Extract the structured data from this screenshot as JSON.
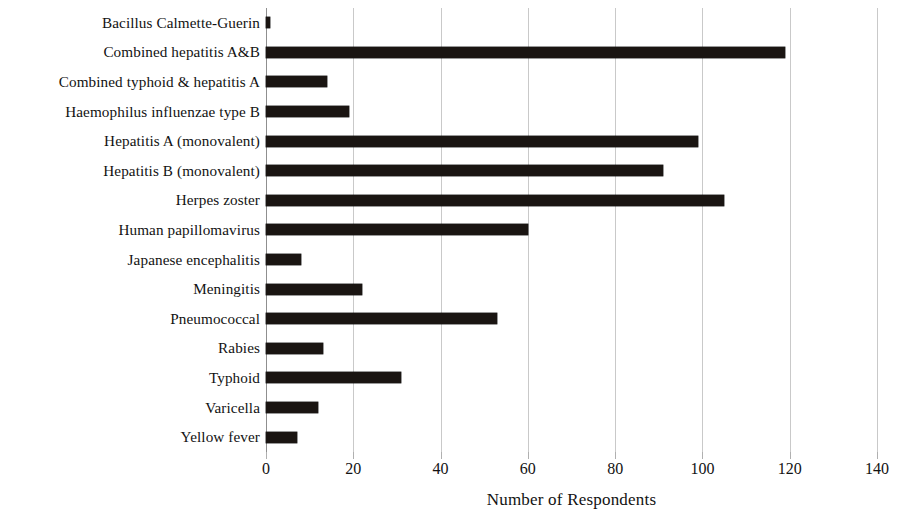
{
  "chart_data": {
    "type": "bar",
    "orientation": "horizontal",
    "title": "",
    "xlabel": "Number of Respondents",
    "ylabel": "",
    "xlim": [
      0,
      140
    ],
    "xticks": [
      0,
      20,
      40,
      60,
      80,
      100,
      120,
      140
    ],
    "xtick_labels": [
      "0",
      "20",
      "40",
      "60",
      "80",
      "100",
      "120",
      "140"
    ],
    "grid": "vertical",
    "legend": "none",
    "bar_color": "#1a1512",
    "categories": [
      "Bacillus Calmette-Guerin",
      "Combined hepatitis A&B",
      "Combined typhoid & hepatitis A",
      "Haemophilus influenzae type B",
      "Hepatitis A (monovalent)",
      "Hepatitis B (monovalent)",
      "Herpes zoster",
      "Human papillomavirus",
      "Japanese encephalitis",
      "Meningitis",
      "Pneumococcal",
      "Rabies",
      "Typhoid",
      "Varicella",
      "Yellow fever"
    ],
    "values": [
      1,
      119,
      14,
      19,
      99,
      91,
      105,
      60,
      8,
      22,
      53,
      13,
      31,
      12,
      7
    ]
  }
}
